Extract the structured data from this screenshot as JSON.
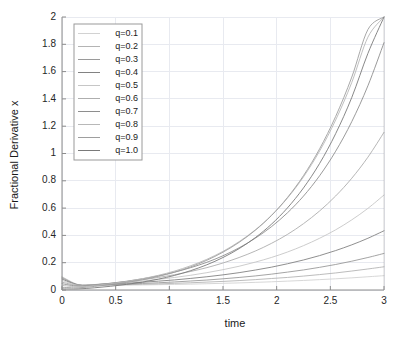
{
  "chart_data": {
    "type": "line",
    "title": "",
    "xlabel": "time",
    "ylabel": "Fractional Derivative x",
    "xlim": [
      0,
      3
    ],
    "ylim": [
      0,
      2
    ],
    "xticks": [
      "0",
      "0.5",
      "1",
      "1.5",
      "2",
      "2.5",
      "3"
    ],
    "xtick_values": [
      0,
      0.5,
      1,
      1.5,
      2,
      2.5,
      3
    ],
    "yticks": [
      "0",
      "0.2",
      "0.4",
      "0.6",
      "0.8",
      "1",
      "1.2",
      "1.4",
      "1.6",
      "1.8",
      "2"
    ],
    "ytick_values": [
      0,
      0.2,
      0.4,
      0.6,
      0.8,
      1,
      1.2,
      1.4,
      1.6,
      1.8,
      2
    ],
    "grid": true,
    "legend_position": "upper-left",
    "x": [
      0,
      0.15,
      0.3,
      0.45,
      0.6,
      0.75,
      0.9,
      1.05,
      1.2,
      1.35,
      1.5,
      1.65,
      1.8,
      1.95,
      2.1,
      2.25,
      2.4,
      2.55,
      2.7,
      2.85,
      3
    ],
    "series": [
      {
        "name": "q=0.1",
        "color": "#d2d2d2",
        "values": [
          0.098,
          0.04,
          0.036,
          0.035,
          0.036,
          0.037,
          0.039,
          0.041,
          0.043,
          0.046,
          0.049,
          0.052,
          0.056,
          0.06,
          0.065,
          0.07,
          0.076,
          0.082,
          0.089,
          0.097,
          0.105
        ]
      },
      {
        "name": "q=0.2",
        "color": "#b4b4b4",
        "values": [
          0.094,
          0.038,
          0.036,
          0.037,
          0.039,
          0.042,
          0.045,
          0.049,
          0.053,
          0.058,
          0.063,
          0.069,
          0.076,
          0.084,
          0.092,
          0.102,
          0.113,
          0.125,
          0.139,
          0.154,
          0.17
        ]
      },
      {
        "name": "q=0.3",
        "color": "#9a9a9a",
        "values": [
          0.088,
          0.038,
          0.038,
          0.04,
          0.044,
          0.048,
          0.053,
          0.059,
          0.066,
          0.073,
          0.082,
          0.092,
          0.103,
          0.116,
          0.131,
          0.147,
          0.166,
          0.187,
          0.211,
          0.238,
          0.268
        ]
      },
      {
        "name": "q=0.4",
        "color": "#828282",
        "values": [
          0.08,
          0.037,
          0.039,
          0.044,
          0.05,
          0.057,
          0.065,
          0.074,
          0.085,
          0.097,
          0.111,
          0.127,
          0.146,
          0.167,
          0.192,
          0.22,
          0.252,
          0.289,
          0.331,
          0.379,
          0.434
        ]
      },
      {
        "name": "q=0.5",
        "color": "#c6c6c6",
        "values": [
          0.07,
          0.035,
          0.04,
          0.047,
          0.056,
          0.066,
          0.078,
          0.092,
          0.108,
          0.127,
          0.149,
          0.174,
          0.204,
          0.238,
          0.278,
          0.325,
          0.379,
          0.441,
          0.514,
          0.598,
          0.696
        ]
      },
      {
        "name": "q=0.6",
        "color": "#aeaeae",
        "values": [
          0.058,
          0.032,
          0.039,
          0.049,
          0.061,
          0.075,
          0.092,
          0.112,
          0.136,
          0.164,
          0.198,
          0.238,
          0.285,
          0.341,
          0.407,
          0.486,
          0.579,
          0.689,
          0.819,
          0.973,
          1.155
        ]
      },
      {
        "name": "q=0.7",
        "color": "#8e8e8e",
        "values": [
          0.046,
          0.028,
          0.037,
          0.049,
          0.064,
          0.082,
          0.104,
          0.131,
          0.164,
          0.203,
          0.251,
          0.309,
          0.379,
          0.463,
          0.565,
          0.688,
          0.837,
          1.017,
          1.234,
          1.496,
          1.812
        ]
      },
      {
        "name": "q=0.8",
        "color": "#b8b8b8",
        "values": [
          0.034,
          0.023,
          0.033,
          0.046,
          0.062,
          0.083,
          0.108,
          0.139,
          0.178,
          0.225,
          0.283,
          0.354,
          0.44,
          0.545,
          0.673,
          0.829,
          1.018,
          1.246,
          1.521,
          1.852,
          2.0
        ]
      },
      {
        "name": "q=0.9",
        "color": "#9e9e9e",
        "values": [
          0.02,
          0.016,
          0.026,
          0.039,
          0.055,
          0.075,
          0.1,
          0.131,
          0.17,
          0.218,
          0.277,
          0.349,
          0.437,
          0.545,
          0.677,
          0.838,
          1.034,
          1.272,
          1.56,
          1.908,
          2.0
        ]
      },
      {
        "name": "q=1.0",
        "color": "#7a7a7a",
        "values": [
          0.008,
          0.008,
          0.016,
          0.027,
          0.041,
          0.058,
          0.08,
          0.107,
          0.142,
          0.185,
          0.238,
          0.303,
          0.383,
          0.481,
          0.601,
          0.748,
          0.927,
          1.146,
          1.411,
          1.733,
          2.0
        ]
      }
    ]
  },
  "legend": {
    "entries": [
      "q=0.1",
      "q=0.2",
      "q=0.3",
      "q=0.4",
      "q=0.5",
      "q=0.6",
      "q=0.7",
      "q=0.8",
      "q=0.9",
      "q=1.0"
    ]
  }
}
